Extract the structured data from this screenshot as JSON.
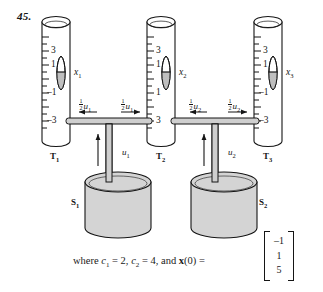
{
  "figure": {
    "problem_number": "45.",
    "tubes": [
      {
        "id": "T1",
        "tank_label": "T",
        "tank_sub": "1",
        "state_var": "x",
        "state_sub": "1",
        "tick_labels": [
          "3",
          "1",
          "–1",
          "–3"
        ]
      },
      {
        "id": "T2",
        "tank_label": "T",
        "tank_sub": "2",
        "state_var": "x",
        "state_sub": "2",
        "tick_labels": [
          "3",
          "1",
          "1",
          "3"
        ]
      },
      {
        "id": "T3",
        "tank_label": "T",
        "tank_sub": "3",
        "state_var": "x",
        "state_sub": "3",
        "tick_labels": [
          "3",
          "1",
          "–1",
          "–3"
        ]
      }
    ],
    "sumps": [
      {
        "id": "S1",
        "label": "S",
        "sub": "1"
      },
      {
        "id": "S2",
        "label": "S",
        "sub": "2"
      }
    ],
    "flow_labels": {
      "half_numerator": "1",
      "half_denominator": "2",
      "half_u1_left": "u",
      "half_u1_left_sub": "1",
      "half_u1_right": "u",
      "half_u1_right_sub": "1",
      "half_u2_left": "u",
      "half_u2_left_sub": "2",
      "half_u2_right": "u",
      "half_u2_right_sub": "2",
      "u1": "u",
      "u1_sub": "1",
      "u2": "u",
      "u2_sub": "2"
    },
    "caption": {
      "where": "where ",
      "c1": "c",
      "c1_sub": "1",
      "eq1": " = 2, ",
      "c2": "c",
      "c2_sub": "2",
      "eq2": " = 4, and ",
      "xbold": "x",
      "x0": "(0)",
      "equals": " = "
    },
    "initial_vector": [
      "–1",
      "1",
      "5"
    ],
    "colors": {
      "ink": "#151515",
      "tube_fill": "#ffffff",
      "sump_fill": "#d4d4d4",
      "float_fill": "#bfbfbf",
      "pipe_fill": "#cfcfcf"
    }
  }
}
